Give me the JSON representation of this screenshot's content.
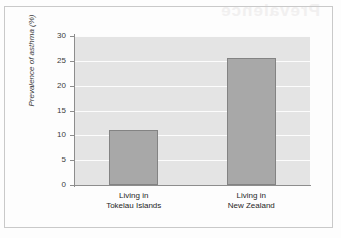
{
  "figure": {
    "ghost_text": "Prevalence",
    "background_color": "#fdfdfd",
    "frame_color": "#c9c9c9"
  },
  "chart_data": {
    "type": "bar",
    "title": "",
    "subtitle": "",
    "xlabel": "",
    "ylabel": "Prevalence of asthma (%)",
    "categories": [
      "Living in\nTokelau Islands",
      "Living in\nNew Zealand"
    ],
    "category_lines": [
      [
        "Living in",
        "Tokelau Islands"
      ],
      [
        "Living in",
        "New Zealand"
      ]
    ],
    "values": [
      11.1,
      25.6
    ],
    "ylim": [
      0,
      30
    ],
    "ytick_labels": [
      "0",
      "5",
      "10",
      "15",
      "20",
      "25",
      "30"
    ],
    "ytick_values": [
      0,
      5,
      10,
      15,
      20,
      25,
      30
    ],
    "grid": true,
    "grid_orientation": "horizontal",
    "grid_color": "#fcfcfc",
    "legend": null,
    "legend_position": "none",
    "bar_color": "#a8a8a8",
    "bar_edge_color": "#838383",
    "plot_background_color": "#e4e4e4",
    "axis_color": "#8d8d8d",
    "text_color": "#3b3b3b"
  }
}
